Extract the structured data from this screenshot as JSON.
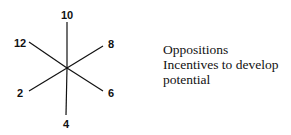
{
  "diagram": {
    "type": "six-spoke star",
    "center": [
      67,
      68
    ],
    "spokes": [
      {
        "label": "10",
        "end": [
          67,
          22
        ],
        "label_pos": [
          67,
          19
        ]
      },
      {
        "label": "8",
        "end": [
          103,
          46
        ],
        "label_pos": [
          111,
          48
        ]
      },
      {
        "label": "6",
        "end": [
          103,
          91
        ],
        "label_pos": [
          111,
          97
        ]
      },
      {
        "label": "4",
        "end": [
          66,
          115
        ],
        "label_pos": [
          66,
          128
        ]
      },
      {
        "label": "2",
        "end": [
          29,
          91
        ],
        "label_pos": [
          20,
          97
        ]
      },
      {
        "label": "12",
        "end": [
          29,
          42
        ],
        "label_pos": [
          20,
          47
        ]
      }
    ],
    "line_color": "#111111"
  },
  "legend": {
    "lines": [
      "Oppositions",
      "Incentives to develop",
      "potential"
    ]
  }
}
